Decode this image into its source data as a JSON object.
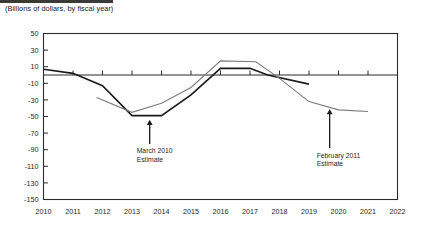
{
  "page": {
    "subtitle": "(Billions of dollars, by fiscal year)"
  },
  "chart_data": {
    "type": "line",
    "title": "",
    "subtitle": "(Billions of dollars, by fiscal year)",
    "xlabel": "",
    "ylabel": "",
    "xlim": [
      2010,
      2022
    ],
    "ylim": [
      -150,
      50
    ],
    "yticks": [
      50,
      30,
      10,
      -10,
      -30,
      -50,
      -70,
      -90,
      -110,
      -130,
      -150
    ],
    "ytick_labels": [
      "50",
      "30",
      "10",
      "-10",
      "-30",
      "-50",
      "-70",
      "-90",
      "-110",
      "-130",
      "-150"
    ],
    "xticks": [
      2010,
      2011,
      2012,
      2013,
      2014,
      2015,
      2016,
      2017,
      2018,
      2019,
      2020,
      2021,
      2022
    ],
    "xtick_labels": [
      "2010",
      "2011",
      "2012",
      "2013",
      "2014",
      "2015",
      "2016",
      "2017",
      "2018",
      "2019",
      "2020",
      "2021",
      "2022"
    ],
    "grid": false,
    "legend": "none",
    "zero_line": 0,
    "series": [
      {
        "name": "February 2011 Estimate",
        "color": "#1a1a1a",
        "width": 1.6,
        "x": [
          2010,
          2011,
          2012,
          2013,
          2014,
          2015,
          2016,
          2017,
          2017.6,
          2019
        ],
        "values": [
          7,
          2,
          -13,
          -49,
          -49,
          -24,
          8,
          8,
          0,
          -11
        ]
      },
      {
        "name": "March 2010 Estimate",
        "color": "#7c7c7c",
        "width": 1.1,
        "x": [
          2011.8,
          2013,
          2014,
          2015,
          2016,
          2017.2,
          2018,
          2019,
          2020,
          2021
        ],
        "values": [
          -27,
          -45,
          -34,
          -15,
          17,
          16,
          -4,
          -32,
          -42,
          -44
        ]
      }
    ],
    "annotations": [
      {
        "label_line1": "March 2010",
        "label_line2": "Estimate",
        "arrow": "up-arrow",
        "x": 2013.6,
        "y_tip": -54,
        "y_tail": -83
      },
      {
        "label_line1": "February 2011",
        "label_line2": "Estimate",
        "arrow": "up-arrow",
        "x": 2019.7,
        "y_tip": -41,
        "y_tail": -88
      }
    ]
  }
}
